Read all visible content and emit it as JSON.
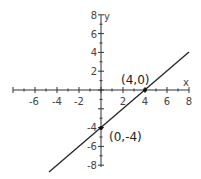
{
  "chart_data": {
    "type": "line",
    "title": "",
    "xlabel": "x",
    "ylabel": "y",
    "xlim": [
      -8,
      8
    ],
    "ylim": [
      -8,
      8
    ],
    "x_ticks": [
      -6,
      -4,
      -2,
      2,
      4,
      6,
      8
    ],
    "y_ticks": [
      8,
      6,
      4,
      2,
      -4,
      -6,
      -8
    ],
    "grid": false,
    "legend": null,
    "series": [
      {
        "name": "y = x - 4",
        "x": [
          -4.2,
          8
        ],
        "y": [
          -8.2,
          4
        ]
      }
    ],
    "points": [
      {
        "x": 4,
        "y": 0,
        "label": "(4,0)"
      },
      {
        "x": 0,
        "y": -4,
        "label": "(0,-4)"
      }
    ]
  },
  "labels": {
    "x_axis": "x",
    "y_axis": "y",
    "point_a": "(4,0)",
    "point_b": "(0,-4)",
    "xt": [
      "-6",
      "-4",
      "-2",
      "2",
      "4",
      "6",
      "8"
    ],
    "yt": [
      "8",
      "6",
      "4",
      "2",
      "-4",
      "-6",
      "-8"
    ]
  }
}
